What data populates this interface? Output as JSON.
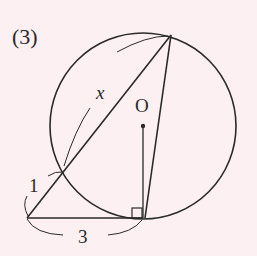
{
  "problem": {
    "number_label": "(3)"
  },
  "diagram": {
    "colors": {
      "background": "#fcf0f3",
      "stroke": "#2a2a2a"
    },
    "circle": {
      "cx": 143,
      "cy": 126,
      "r": 93
    },
    "points": {
      "P": {
        "x": 27,
        "y": 218
      },
      "A": {
        "x": 62,
        "y": 172
      },
      "B": {
        "x": 171,
        "y": 35
      },
      "T": {
        "x": 143,
        "y": 218
      },
      "O": {
        "x": 143,
        "y": 126
      }
    },
    "labels": {
      "center": "O",
      "segment_PA": "1",
      "segment_AB": "x",
      "segment_PT": "3"
    },
    "right_angle_marker": "at T between OT and PT"
  }
}
